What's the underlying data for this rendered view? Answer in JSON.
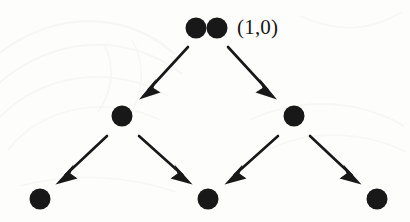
{
  "figure": {
    "name": "binary-branching-tree-diagram",
    "background_color": "#fdfdfc",
    "ink_color": "#181818",
    "width": 410,
    "height": 222,
    "labels": {
      "root": "(1,0)"
    },
    "nodes": [
      {
        "id": "root-a",
        "row": 0,
        "cx": 196,
        "cy": 28,
        "r": 10.5,
        "doubled": true
      },
      {
        "id": "root-b",
        "row": 0,
        "cx": 217,
        "cy": 28,
        "r": 10.5,
        "doubled": true
      },
      {
        "id": "mid-left",
        "row": 1,
        "cx": 122,
        "cy": 116,
        "r": 10.5,
        "doubled": false
      },
      {
        "id": "mid-right",
        "row": 1,
        "cx": 294,
        "cy": 116,
        "r": 10.5,
        "doubled": false
      },
      {
        "id": "leaf-left",
        "row": 2,
        "cx": 40,
        "cy": 199,
        "r": 10.5,
        "doubled": false
      },
      {
        "id": "leaf-middle",
        "row": 2,
        "cx": 208,
        "cy": 199,
        "r": 10.5,
        "doubled": false
      },
      {
        "id": "leaf-right",
        "row": 2,
        "cx": 377,
        "cy": 199,
        "r": 10.5,
        "doubled": false
      }
    ],
    "arrows": [
      {
        "id": "arrow-root-to-mid-left",
        "from": "root-a",
        "to": "mid-left",
        "x1": 188,
        "y1": 47,
        "x2": 142,
        "y2": 97
      },
      {
        "id": "arrow-root-to-mid-right",
        "from": "root-b",
        "to": "mid-right",
        "x1": 228,
        "y1": 47,
        "x2": 274,
        "y2": 97
      },
      {
        "id": "arrow-mid-left-to-leaf-left",
        "from": "mid-left",
        "to": "leaf-left",
        "x1": 107,
        "y1": 136,
        "x2": 58,
        "y2": 182
      },
      {
        "id": "arrow-mid-left-to-leaf-middle",
        "from": "mid-left",
        "to": "leaf-middle",
        "x1": 139,
        "y1": 136,
        "x2": 191,
        "y2": 182
      },
      {
        "id": "arrow-mid-right-to-leaf-middle",
        "from": "mid-right",
        "to": "leaf-middle",
        "x1": 278,
        "y1": 136,
        "x2": 226,
        "y2": 182
      },
      {
        "id": "arrow-mid-right-to-leaf-right",
        "from": "mid-right",
        "to": "leaf-right",
        "x1": 310,
        "y1": 136,
        "x2": 360,
        "y2": 182
      }
    ]
  }
}
